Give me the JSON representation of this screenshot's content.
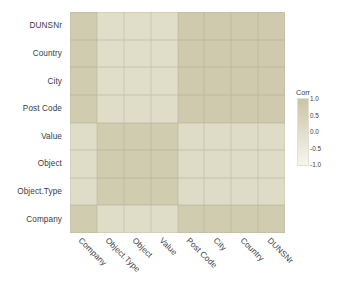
{
  "chart_data": {
    "type": "heatmap",
    "title": "",
    "xlabel": "",
    "ylabel": "",
    "legend": {
      "title": "Corr",
      "position": "right",
      "ticks": [
        "1.0",
        "0.5",
        "0.0",
        "-0.5",
        "-1.0"
      ],
      "tick_values": [
        1.0,
        0.5,
        0.0,
        -0.5,
        -1.0
      ],
      "gradient_high_color": "#cdc8a6",
      "gradient_low_color": "#f7f6ee"
    },
    "x_categories": [
      "Company",
      "Object.Type",
      "Object",
      "Value",
      "Post Code",
      "City",
      "Country",
      "DUNSNr"
    ],
    "y_categories": [
      "DUNSNr",
      "Country",
      "City",
      "Post Code",
      "Value",
      "Object",
      "Object.Type",
      "Company"
    ],
    "grid": true,
    "zlim": [
      -1.0,
      1.0
    ],
    "values": [
      [
        0.72,
        0.02,
        0.02,
        0.02,
        0.78,
        0.78,
        0.78,
        0.78
      ],
      [
        0.72,
        0.02,
        0.02,
        0.02,
        0.78,
        0.78,
        0.78,
        0.78
      ],
      [
        0.72,
        0.02,
        0.02,
        0.02,
        0.78,
        0.78,
        0.78,
        0.78
      ],
      [
        0.72,
        0.05,
        0.05,
        0.05,
        0.78,
        0.78,
        0.78,
        0.78
      ],
      [
        0.05,
        0.72,
        0.72,
        0.72,
        0.1,
        0.1,
        0.1,
        0.1
      ],
      [
        0.05,
        0.72,
        0.72,
        0.72,
        0.1,
        0.1,
        0.1,
        0.1
      ],
      [
        0.05,
        0.72,
        0.72,
        0.72,
        0.1,
        0.1,
        0.1,
        0.1
      ],
      [
        0.72,
        0.08,
        0.08,
        0.08,
        0.72,
        0.72,
        0.72,
        0.72
      ]
    ]
  }
}
